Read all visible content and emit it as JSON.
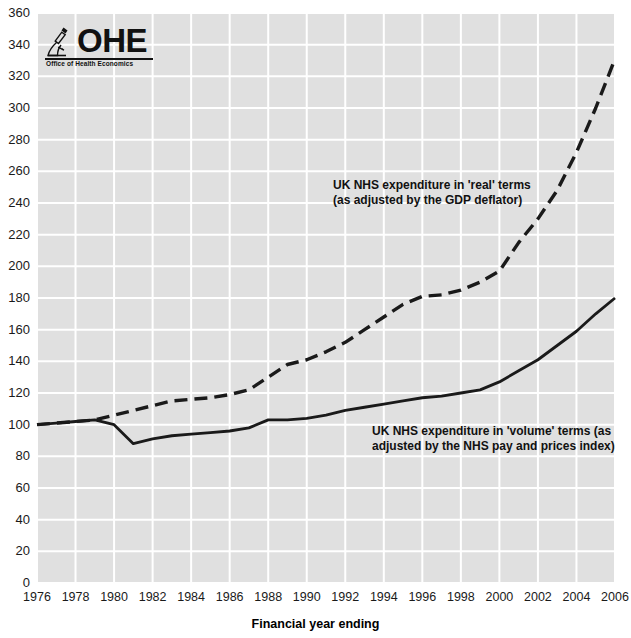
{
  "logo": {
    "wordmark": "OHE",
    "tagline": "Office of Health Economics",
    "icon": "microscope-icon"
  },
  "chart_data": {
    "type": "line",
    "title": "",
    "xlabel": "Financial year ending",
    "ylabel": "",
    "xlim": [
      1976,
      2006
    ],
    "ylim": [
      0,
      360
    ],
    "ytick_step": 20,
    "xtick_step": 2,
    "grid": true,
    "legend_position": "inline-annotations",
    "plot_background": "#e0e0e0",
    "gridline_color": "#ffffff",
    "line_color": "#1a1a1a",
    "yticks": [
      0,
      20,
      40,
      60,
      80,
      100,
      120,
      140,
      160,
      180,
      200,
      220,
      240,
      260,
      280,
      300,
      320,
      340,
      360
    ],
    "xticks": [
      1976,
      1978,
      1980,
      1982,
      1984,
      1986,
      1988,
      1990,
      1992,
      1994,
      1996,
      1998,
      2000,
      2002,
      2004,
      2006
    ],
    "x": [
      1976,
      1977,
      1978,
      1979,
      1980,
      1981,
      1982,
      1983,
      1984,
      1985,
      1986,
      1987,
      1988,
      1989,
      1990,
      1991,
      1992,
      1993,
      1994,
      1995,
      1996,
      1997,
      1998,
      1999,
      2000,
      2001,
      2002,
      2003,
      2004,
      2005,
      2006
    ],
    "series": [
      {
        "name": "UK NHS expenditure in 'real' terms (as adjusted by the GDP deflator)",
        "style": "dashed",
        "values": [
          100,
          101,
          102,
          103,
          106,
          109,
          112,
          115,
          116,
          117,
          119,
          122,
          130,
          138,
          141,
          146,
          152,
          160,
          168,
          176,
          181,
          182,
          185,
          190,
          197,
          215,
          230,
          248,
          272,
          300,
          331
        ]
      },
      {
        "name": "UK NHS expenditure in 'volume' terms (as adjusted by the NHS pay and prices index)",
        "style": "solid",
        "values": [
          100,
          101,
          102,
          103,
          100,
          88,
          91,
          93,
          94,
          95,
          96,
          98,
          103,
          103,
          104,
          106,
          109,
          111,
          113,
          115,
          117,
          118,
          120,
          122,
          127,
          134,
          141,
          150,
          159,
          170,
          180
        ]
      }
    ],
    "annotations": [
      {
        "name": "real-terms-label",
        "line1": "UK NHS expenditure in 'real' terms",
        "line2": "(as adjusted by the GDP deflator)"
      },
      {
        "name": "volume-terms-label",
        "line1": "UK NHS expenditure in 'volume' terms (as",
        "line2": "adjusted by the NHS pay and prices index)"
      }
    ]
  }
}
